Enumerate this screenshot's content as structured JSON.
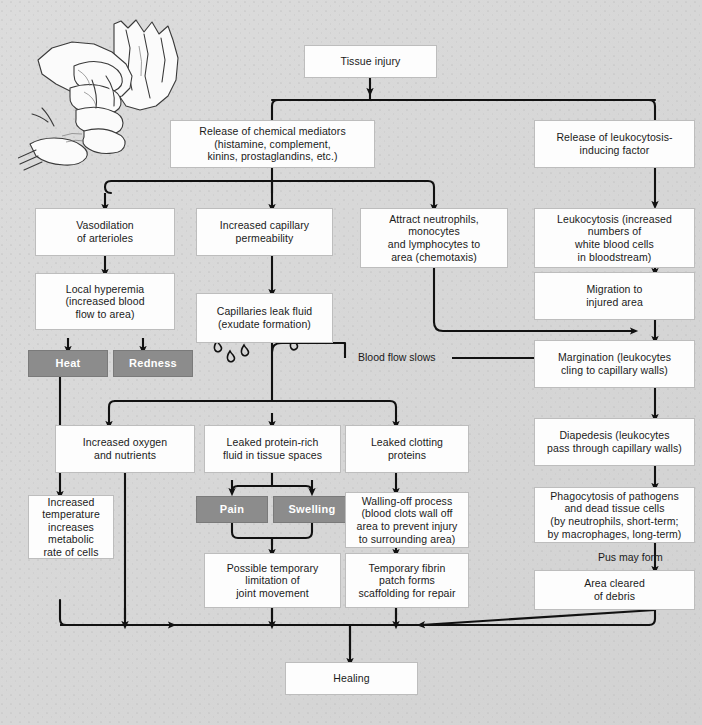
{
  "diagram": {
    "background_color": "#d9d9d9",
    "box_fill": "#fdfdfd",
    "highlight_box_fill": "#8c8c8c",
    "highlight_text_color": "#ffffff",
    "connector_color": "#111111"
  },
  "nodes": {
    "tissue_injury": "Tissue injury",
    "release_chemical_mediators": "Release of chemical mediators\n(histamine, complement,\nkinins, prostaglandins, etc.)",
    "release_leukocytosis_factor": "Release of leukocytosis-\ninducing factor",
    "vasodilation": "Vasodilation\nof arterioles",
    "increased_capillary_permeability": "Increased capillary\npermeability",
    "attract_neutrophils": "Attract neutrophils,\nmonocytes\nand lymphocytes to\narea (chemotaxis)",
    "leukocytosis": "Leukocytosis (increased\nnumbers of\nwhite blood cells\nin bloodstream)",
    "local_hyperemia": "Local hyperemia\n(increased blood\nflow to area)",
    "migration_injured_area": "Migration to\ninjured area",
    "capillaries_leak_fluid": "Capillaries leak fluid\n(exudate formation)",
    "heat": "Heat",
    "redness": "Redness",
    "margination": "Margination (leukocytes\ncling to capillary walls)",
    "diapedesis": "Diapedesis (leukocytes\npass through capillary walls)",
    "increased_oxygen": "Increased oxygen\nand nutrients",
    "leaked_protein_rich_fluid": "Leaked protein-rich\nfluid in tissue spaces",
    "leaked_clotting_proteins": "Leaked clotting\nproteins",
    "phagocytosis": "Phagocytosis of pathogens\nand dead tissue cells\n(by neutrophils, short-term;\nby macrophages, long-term)",
    "pain": "Pain",
    "swelling": "Swelling",
    "walling_off_process": "Walling-off process\n(blood clots wall off\narea to prevent injury\nto surrounding area)",
    "increased_temperature": "Increased\ntemperature\nincreases\nmetabolic\nrate of cells",
    "possible_temporary_limitation": "Possible temporary\nlimitation of\njoint movement",
    "temporary_fibrin_patch": "Temporary fibrin\npatch forms\nscaffolding for repair",
    "area_cleared_of_debris": "Area cleared\nof debris",
    "healing": "Healing"
  },
  "edge_labels": {
    "blood_flow_slows": "Blood flow slows",
    "pus_may_form": "Pus may form"
  },
  "illustration": {
    "name": "hand-illustration",
    "description": "Line drawing of a hand gripping a crushed object"
  }
}
